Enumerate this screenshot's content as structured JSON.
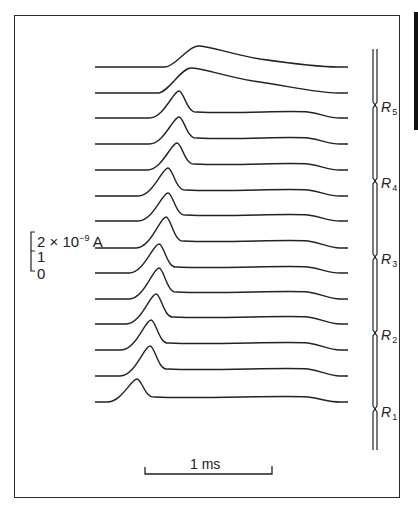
{
  "figure": {
    "current_scale": {
      "top_label": "2 × 10",
      "exponent": "−9",
      "unit": " A",
      "mid_label": "1",
      "bottom_label": "0"
    },
    "time_scale": {
      "label": "1 ms"
    },
    "regions": [
      {
        "label": "R",
        "sub": "5"
      },
      {
        "label": "R",
        "sub": "4"
      },
      {
        "label": "R",
        "sub": "3"
      },
      {
        "label": "R",
        "sub": "2"
      },
      {
        "label": "R",
        "sub": "1"
      }
    ]
  },
  "chart_data": {
    "type": "line",
    "title": "",
    "xlabel": "time (scale bar 1 ms)",
    "ylabel": "current (scale bar 2 × 10^-9 A)",
    "grid": false,
    "traces": [
      {
        "index": 1,
        "baseline_y": 67,
        "peak_x": 200,
        "peak_h": 21,
        "shape": "broad"
      },
      {
        "index": 2,
        "baseline_y": 93,
        "peak_x": 193,
        "peak_h": 25,
        "shape": "broad"
      },
      {
        "index": 3,
        "baseline_y": 118,
        "peak_x": 179,
        "peak_h": 27,
        "shape": "sharp"
      },
      {
        "index": 4,
        "baseline_y": 144,
        "peak_x": 179,
        "peak_h": 27,
        "shape": "sharp"
      },
      {
        "index": 5,
        "baseline_y": 170,
        "peak_x": 177,
        "peak_h": 27,
        "shape": "sharp"
      },
      {
        "index": 6,
        "baseline_y": 196,
        "peak_x": 168,
        "peak_h": 28,
        "shape": "sharp"
      },
      {
        "index": 7,
        "baseline_y": 221,
        "peak_x": 168,
        "peak_h": 28,
        "shape": "sharp"
      },
      {
        "index": 8,
        "baseline_y": 248,
        "peak_x": 166,
        "peak_h": 31,
        "shape": "sharp"
      },
      {
        "index": 9,
        "baseline_y": 273,
        "peak_x": 159,
        "peak_h": 29,
        "shape": "sharp"
      },
      {
        "index": 10,
        "baseline_y": 299,
        "peak_x": 159,
        "peak_h": 31,
        "shape": "sharp"
      },
      {
        "index": 11,
        "baseline_y": 324,
        "peak_x": 156,
        "peak_h": 30,
        "shape": "sharp"
      },
      {
        "index": 12,
        "baseline_y": 350,
        "peak_x": 151,
        "peak_h": 30,
        "shape": "sharp"
      },
      {
        "index": 13,
        "baseline_y": 376,
        "peak_x": 150,
        "peak_h": 30,
        "shape": "sharp"
      },
      {
        "index": 14,
        "baseline_y": 402,
        "peak_x": 137,
        "peak_h": 23,
        "shape": "sharp"
      }
    ],
    "x_range_px": [
      95,
      348
    ]
  }
}
